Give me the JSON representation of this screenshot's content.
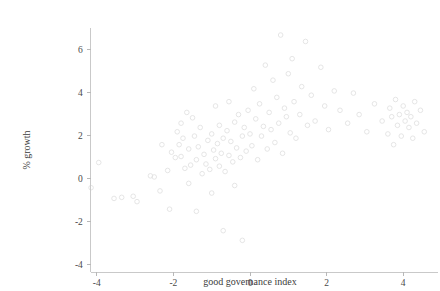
{
  "chart_data": {
    "type": "scatter",
    "title": "",
    "xlabel": "good governance index",
    "ylabel": "% growth",
    "xlim": [
      -4.6,
      4.9
    ],
    "ylim": [
      -4.3,
      6.9
    ],
    "xticks": [
      -4,
      -2,
      0,
      2,
      4
    ],
    "xticklabels": [
      "-4",
      "-2",
      "0",
      "2",
      "4"
    ],
    "yticks": [
      -4,
      -2,
      0,
      2,
      4,
      6
    ],
    "yticklabels": [
      "-4",
      "-2",
      "0",
      "2",
      "4",
      "6"
    ],
    "grid": false,
    "legend": false,
    "marker": "open-circle",
    "marker_color": "#e2e2e2",
    "axis_color": "#c9c9c9",
    "points": [
      [
        -4.15,
        -0.45
      ],
      [
        -3.95,
        0.72
      ],
      [
        -3.55,
        -0.95
      ],
      [
        -3.35,
        -0.9
      ],
      [
        -3.05,
        -0.85
      ],
      [
        -2.95,
        -1.1
      ],
      [
        -2.6,
        0.1
      ],
      [
        -2.5,
        0.05
      ],
      [
        -2.35,
        -0.6
      ],
      [
        -2.3,
        1.55
      ],
      [
        -2.15,
        0.35
      ],
      [
        -2.1,
        -1.45
      ],
      [
        -2.05,
        1.2
      ],
      [
        -1.95,
        0.95
      ],
      [
        -1.9,
        2.15
      ],
      [
        -1.85,
        1.55
      ],
      [
        -1.8,
        1.0
      ],
      [
        -1.8,
        2.55
      ],
      [
        -1.75,
        1.85
      ],
      [
        -1.7,
        0.45
      ],
      [
        -1.65,
        3.05
      ],
      [
        -1.6,
        -0.25
      ],
      [
        -1.6,
        1.35
      ],
      [
        -1.55,
        0.6
      ],
      [
        -1.5,
        2.8
      ],
      [
        -1.45,
        1.95
      ],
      [
        -1.4,
        0.85
      ],
      [
        -1.4,
        -1.55
      ],
      [
        -1.35,
        1.45
      ],
      [
        -1.3,
        2.35
      ],
      [
        -1.25,
        0.2
      ],
      [
        -1.2,
        1.1
      ],
      [
        -1.15,
        0.65
      ],
      [
        -1.1,
        1.75
      ],
      [
        -1.05,
        0.4
      ],
      [
        -1.0,
        2.05
      ],
      [
        -1.0,
        -0.7
      ],
      [
        -0.95,
        1.3
      ],
      [
        -0.9,
        0.9
      ],
      [
        -0.9,
        3.35
      ],
      [
        -0.85,
        1.6
      ],
      [
        -0.8,
        0.55
      ],
      [
        -0.8,
        2.45
      ],
      [
        -0.75,
        1.15
      ],
      [
        -0.7,
        -2.45
      ],
      [
        -0.7,
        1.85
      ],
      [
        -0.65,
        0.3
      ],
      [
        -0.6,
        2.2
      ],
      [
        -0.55,
        1.05
      ],
      [
        -0.55,
        3.55
      ],
      [
        -0.5,
        1.7
      ],
      [
        -0.45,
        0.75
      ],
      [
        -0.4,
        2.6
      ],
      [
        -0.4,
        -0.35
      ],
      [
        -0.35,
        1.4
      ],
      [
        -0.3,
        2.95
      ],
      [
        -0.25,
        0.95
      ],
      [
        -0.2,
        1.95
      ],
      [
        -0.2,
        -2.9
      ],
      [
        -0.15,
        2.35
      ],
      [
        -0.1,
        1.25
      ],
      [
        -0.05,
        3.15
      ],
      [
        0.0,
        2.05
      ],
      [
        0.05,
        1.5
      ],
      [
        0.1,
        4.15
      ],
      [
        0.15,
        2.75
      ],
      [
        0.2,
        0.85
      ],
      [
        0.25,
        3.45
      ],
      [
        0.3,
        1.95
      ],
      [
        0.35,
        2.4
      ],
      [
        0.4,
        5.25
      ],
      [
        0.45,
        1.35
      ],
      [
        0.5,
        3.05
      ],
      [
        0.55,
        2.25
      ],
      [
        0.6,
        4.55
      ],
      [
        0.65,
        1.65
      ],
      [
        0.7,
        3.75
      ],
      [
        0.75,
        2.55
      ],
      [
        0.8,
        6.65
      ],
      [
        0.85,
        1.15
      ],
      [
        0.9,
        3.25
      ],
      [
        0.95,
        2.85
      ],
      [
        1.0,
        4.85
      ],
      [
        1.05,
        2.1
      ],
      [
        1.1,
        5.55
      ],
      [
        1.15,
        3.55
      ],
      [
        1.2,
        1.85
      ],
      [
        1.3,
        2.95
      ],
      [
        1.35,
        4.25
      ],
      [
        1.45,
        6.35
      ],
      [
        1.5,
        2.45
      ],
      [
        1.6,
        3.85
      ],
      [
        1.7,
        2.65
      ],
      [
        1.85,
        5.15
      ],
      [
        1.95,
        3.35
      ],
      [
        2.05,
        2.25
      ],
      [
        2.2,
        4.05
      ],
      [
        2.35,
        3.15
      ],
      [
        2.55,
        2.55
      ],
      [
        2.7,
        3.95
      ],
      [
        2.85,
        2.95
      ],
      [
        3.05,
        2.15
      ],
      [
        3.25,
        3.45
      ],
      [
        3.45,
        2.65
      ],
      [
        3.6,
        2.05
      ],
      [
        3.65,
        3.25
      ],
      [
        3.7,
        2.85
      ],
      [
        3.75,
        1.55
      ],
      [
        3.8,
        3.65
      ],
      [
        3.85,
        2.45
      ],
      [
        3.9,
        2.95
      ],
      [
        3.95,
        1.95
      ],
      [
        4.0,
        3.35
      ],
      [
        4.05,
        2.65
      ],
      [
        4.1,
        3.05
      ],
      [
        4.15,
        2.35
      ],
      [
        4.2,
        2.85
      ],
      [
        4.25,
        1.85
      ],
      [
        4.3,
        3.55
      ],
      [
        4.35,
        2.55
      ],
      [
        4.45,
        3.15
      ],
      [
        4.55,
        2.15
      ]
    ]
  }
}
